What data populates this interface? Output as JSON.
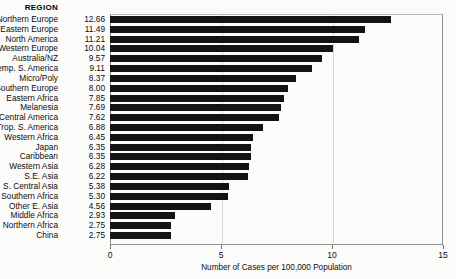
{
  "chart_data": {
    "type": "bar",
    "orientation": "horizontal",
    "title": "",
    "xlabel": "Number of Cases per 100,000 Population",
    "ylabel": "REGION",
    "xlim": [
      0,
      15
    ],
    "xticks": [
      0,
      5,
      10,
      15
    ],
    "xtick_labels": [
      "0",
      "5",
      "10",
      "15"
    ],
    "grid": true,
    "legend": null,
    "bar_color": "#141414",
    "categories": [
      "Northern Europe",
      "Eastern Europe",
      "North America",
      "Western Europe",
      "Australia/NZ",
      "Temp. S. America",
      "Micro/Poly",
      "Southern Europe",
      "Eastern Africa",
      "Melanesia",
      "Central America",
      "Trop. S. America",
      "Western Africa",
      "Japan",
      "Caribbean",
      "Western Asia",
      "S.E. Asia",
      "S. Central Asia",
      "Southern Africa",
      "Other E. Asia",
      "Middle Africa",
      "Northern Africa",
      "China"
    ],
    "values": [
      12.66,
      11.49,
      11.21,
      10.04,
      9.57,
      9.11,
      8.37,
      8.0,
      7.85,
      7.69,
      7.62,
      6.88,
      6.45,
      6.35,
      6.35,
      6.28,
      6.22,
      5.38,
      5.3,
      4.56,
      2.93,
      2.75,
      2.75
    ],
    "value_labels": [
      "12.66",
      "11.49",
      "11.21",
      "10.04",
      "9.57",
      "9.11",
      "8.37",
      "8.00",
      "7.85",
      "7.69",
      "7.62",
      "6.88",
      "6.45",
      "6.35",
      "6.35",
      "6.28",
      "6.22",
      "5.38",
      "5.30",
      "4.56",
      "2.93",
      "2.75",
      "2.75"
    ]
  },
  "header": {
    "region_label": "REGION"
  },
  "axis": {
    "title": "Number of Cases per 100,000 Population",
    "ticks": [
      "0",
      "5",
      "10",
      "15"
    ]
  }
}
